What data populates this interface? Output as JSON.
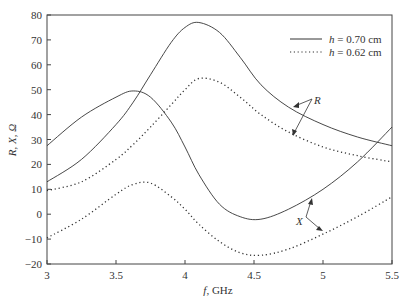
{
  "chart_data": {
    "type": "line",
    "title": "",
    "xlabel": "f, GHz",
    "ylabel": "R, X, Ω",
    "xlim": [
      3,
      5.5
    ],
    "ylim": [
      -20,
      80
    ],
    "xticks": [
      "3",
      "3.5",
      "4",
      "4.5",
      "5",
      "5.5"
    ],
    "yticks": [
      "80",
      "70",
      "60",
      "50",
      "40",
      "30",
      "20",
      "10",
      "0",
      "-10",
      "-20"
    ],
    "grid": false,
    "legend_position": "upper right",
    "x": [
      3.0,
      3.25,
      3.5,
      3.625,
      3.75,
      3.9,
      4.0,
      4.1,
      4.25,
      4.4,
      4.55,
      4.75,
      5.0,
      5.25,
      5.5
    ],
    "series": [
      {
        "name": "h=0.70 cm",
        "quantity": "R",
        "style": "solid",
        "values": [
          13,
          22,
          36,
          45,
          56,
          69,
          75,
          77,
          73,
          63,
          52,
          43,
          36,
          31,
          27.5
        ]
      },
      {
        "name": "h=0.70 cm",
        "quantity": "X",
        "style": "solid",
        "values": [
          27.5,
          39,
          47,
          49.5,
          47,
          37,
          27,
          16,
          4,
          -1,
          -2,
          2,
          10,
          21,
          35
        ]
      },
      {
        "name": "h=0.62 cm",
        "quantity": "R",
        "style": "dotted",
        "values": [
          9.5,
          13,
          22,
          28,
          35,
          44,
          50,
          54.5,
          53,
          47,
          40,
          33,
          27,
          23.5,
          21
        ]
      },
      {
        "name": "h=0.62 cm",
        "quantity": "X",
        "style": "dotted",
        "values": [
          -9.5,
          -2,
          8,
          12,
          12.5,
          7,
          2,
          -4,
          -11,
          -15.5,
          -16.5,
          -14,
          -8,
          -1,
          7
        ]
      }
    ],
    "annotations": [
      {
        "text": "R",
        "points_to": [
          "h=0.70 cm R",
          "h=0.62 cm R"
        ]
      },
      {
        "text": "X",
        "points_to": [
          "h=0.70 cm X",
          "h=0.62 cm X"
        ]
      }
    ]
  },
  "legend": [
    {
      "prefix": "h",
      "text": " = 0.70 cm",
      "style": "solid"
    },
    {
      "prefix": "h",
      "text": " = 0.62 cm",
      "style": "dotted"
    }
  ],
  "annotations": {
    "r_label": "R",
    "x_label": "X"
  },
  "axes": {
    "xlabel_italic": "f",
    "xlabel_rest": ", GHz",
    "ylabel": "R, X, Ω"
  }
}
